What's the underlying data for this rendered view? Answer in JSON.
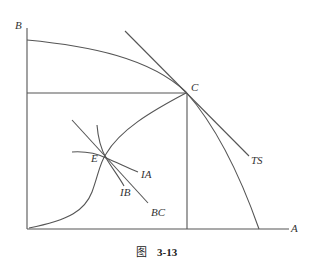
{
  "figure": {
    "caption_prefix": "图",
    "caption_number": "3-13",
    "colors": {
      "line": "#555555",
      "text": "#333333",
      "background": "#ffffff"
    },
    "axes": {
      "y_label": "B",
      "x_label": "A"
    },
    "labels": {
      "point_c": "C",
      "point_e": "E",
      "terms_of_trade_line": "TS",
      "indifference_a": "IA",
      "indifference_b": "IB",
      "budget_contract": "BC"
    }
  }
}
